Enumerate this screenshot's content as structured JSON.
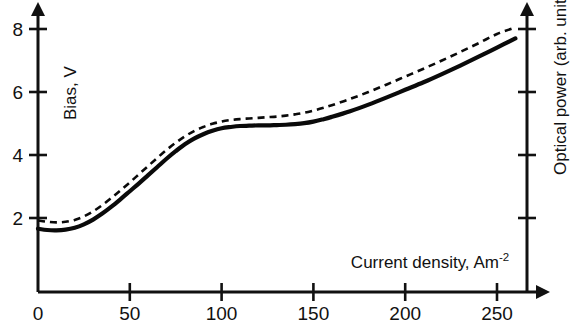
{
  "chart_data": {
    "type": "line",
    "title": "",
    "xlabel": "Current density, Am-2",
    "xlabel_base": "Current density, Am",
    "xlabel_sup": "-2",
    "ylabel_left": "Bias, V",
    "ylabel_right": "Optical power (arb. units)",
    "xlim": [
      0,
      272
    ],
    "ylim_left": [
      0,
      8.75
    ],
    "x_ticks": [
      0,
      50,
      100,
      150,
      200,
      250
    ],
    "x_tick_labels": [
      "0",
      "50",
      "100",
      "150",
      "200",
      "250"
    ],
    "y_ticks_left": [
      2,
      4,
      6,
      8
    ],
    "y_tick_labels_left": [
      "2",
      "4",
      "6",
      "8"
    ],
    "y_ticks_right_count": 4,
    "y_ticks_right_labels": [
      "",
      "",
      "",
      ""
    ],
    "grid": false,
    "legend": "none",
    "axis_arrows": true,
    "series": [
      {
        "name": "Bias",
        "style": "solid",
        "color": "#0a0a0a",
        "axis": "left",
        "x": [
          0,
          5,
          10,
          15,
          20,
          25,
          30,
          35,
          40,
          45,
          50,
          55,
          60,
          65,
          70,
          75,
          80,
          85,
          90,
          95,
          100,
          105,
          110,
          115,
          120,
          125,
          130,
          135,
          140,
          145,
          150,
          155,
          160,
          170,
          180,
          190,
          200,
          210,
          220,
          230,
          240,
          250,
          260
        ],
        "y": [
          1.66,
          1.62,
          1.61,
          1.63,
          1.69,
          1.8,
          1.95,
          2.14,
          2.36,
          2.6,
          2.85,
          3.1,
          3.36,
          3.62,
          3.88,
          4.12,
          4.34,
          4.52,
          4.66,
          4.77,
          4.85,
          4.89,
          4.92,
          4.93,
          4.94,
          4.94,
          4.95,
          4.96,
          4.98,
          5.01,
          5.06,
          5.13,
          5.21,
          5.39,
          5.6,
          5.83,
          6.07,
          6.31,
          6.57,
          6.84,
          7.12,
          7.41,
          7.7
        ]
      },
      {
        "name": "Optical power",
        "style": "dashed",
        "color": "#0a0a0a",
        "axis": "right",
        "x": [
          0,
          5,
          10,
          15,
          20,
          25,
          30,
          35,
          40,
          45,
          50,
          55,
          60,
          65,
          70,
          75,
          80,
          85,
          90,
          95,
          100,
          105,
          110,
          115,
          120,
          125,
          130,
          135,
          140,
          145,
          150,
          155,
          160,
          170,
          180,
          190,
          200,
          210,
          220,
          230,
          240,
          250,
          260
        ],
        "y": [
          1.92,
          1.88,
          1.86,
          1.88,
          1.94,
          2.05,
          2.21,
          2.41,
          2.64,
          2.88,
          3.13,
          3.39,
          3.65,
          3.91,
          4.16,
          4.39,
          4.59,
          4.76,
          4.89,
          4.99,
          5.06,
          5.11,
          5.14,
          5.16,
          5.18,
          5.2,
          5.22,
          5.25,
          5.29,
          5.34,
          5.41,
          5.49,
          5.58,
          5.78,
          6.0,
          6.24,
          6.49,
          6.74,
          7.0,
          7.27,
          7.55,
          7.84,
          8.05
        ]
      }
    ]
  }
}
